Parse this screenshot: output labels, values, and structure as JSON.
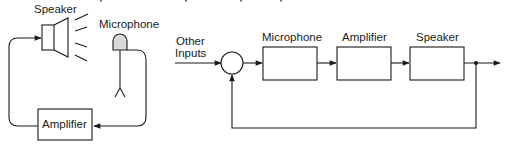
{
  "physical_diagram": {
    "speaker_label": "Speaker",
    "microphone_label": "Microphone",
    "amplifier_label": "Amplifier"
  },
  "block_diagram": {
    "input_label_line1": "Other",
    "input_label_line2": "Inputs",
    "blocks": [
      {
        "label": "Microphone"
      },
      {
        "label": "Amplifier"
      },
      {
        "label": "Speaker"
      }
    ],
    "summing_junction": "circle",
    "feedback": "output fed back to summing junction"
  }
}
